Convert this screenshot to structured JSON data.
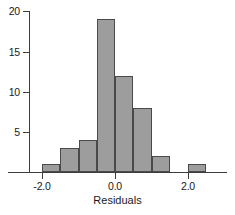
{
  "figure": {
    "width": 235,
    "height": 215,
    "background": "#ffffff"
  },
  "chart_data": {
    "type": "bar",
    "title": "",
    "subtitle": "",
    "xlabel": "Residuals",
    "ylabel": "",
    "orientation": "vertical",
    "grid": false,
    "legend": null,
    "bar_fill_color": "#9d9d9d",
    "bar_edge_color": "#4a4a4a",
    "axis_color": "#3d3d3d",
    "text_color": "#1a1a1a",
    "bin_width": 0.5,
    "xlim": [
      -2.5,
      2.75
    ],
    "ylim": [
      0,
      20.5
    ],
    "x_ticks": [
      -2.0,
      0.0,
      2.0
    ],
    "x_tick_labels": [
      "-2.0",
      "0.0",
      "2.0"
    ],
    "y_ticks": [
      5,
      10,
      15,
      20
    ],
    "y_tick_labels": [
      "5",
      "10",
      "15",
      "20"
    ],
    "bins": [
      {
        "left": -2.0,
        "right": -1.5,
        "center": -1.75,
        "count": 1
      },
      {
        "left": -1.5,
        "right": -1.0,
        "center": -1.25,
        "count": 3
      },
      {
        "left": -1.0,
        "right": -0.5,
        "center": -0.75,
        "count": 4
      },
      {
        "left": -0.5,
        "right": 0.0,
        "center": -0.25,
        "count": 19
      },
      {
        "left": 0.0,
        "right": 0.5,
        "center": 0.25,
        "count": 12
      },
      {
        "left": 0.5,
        "right": 1.0,
        "center": 0.75,
        "count": 8
      },
      {
        "left": 1.0,
        "right": 1.5,
        "center": 1.25,
        "count": 2
      },
      {
        "left": 1.5,
        "right": 2.0,
        "center": 1.75,
        "count": 0
      },
      {
        "left": 2.0,
        "right": 2.5,
        "center": 2.25,
        "count": 1
      }
    ],
    "categories": [
      "-1.75",
      "-1.25",
      "-0.75",
      "-0.25",
      "0.25",
      "0.75",
      "1.25",
      "1.75",
      "2.25"
    ],
    "values": [
      1,
      3,
      4,
      19,
      12,
      8,
      2,
      0,
      1
    ],
    "total_count": 50,
    "annotations": []
  }
}
